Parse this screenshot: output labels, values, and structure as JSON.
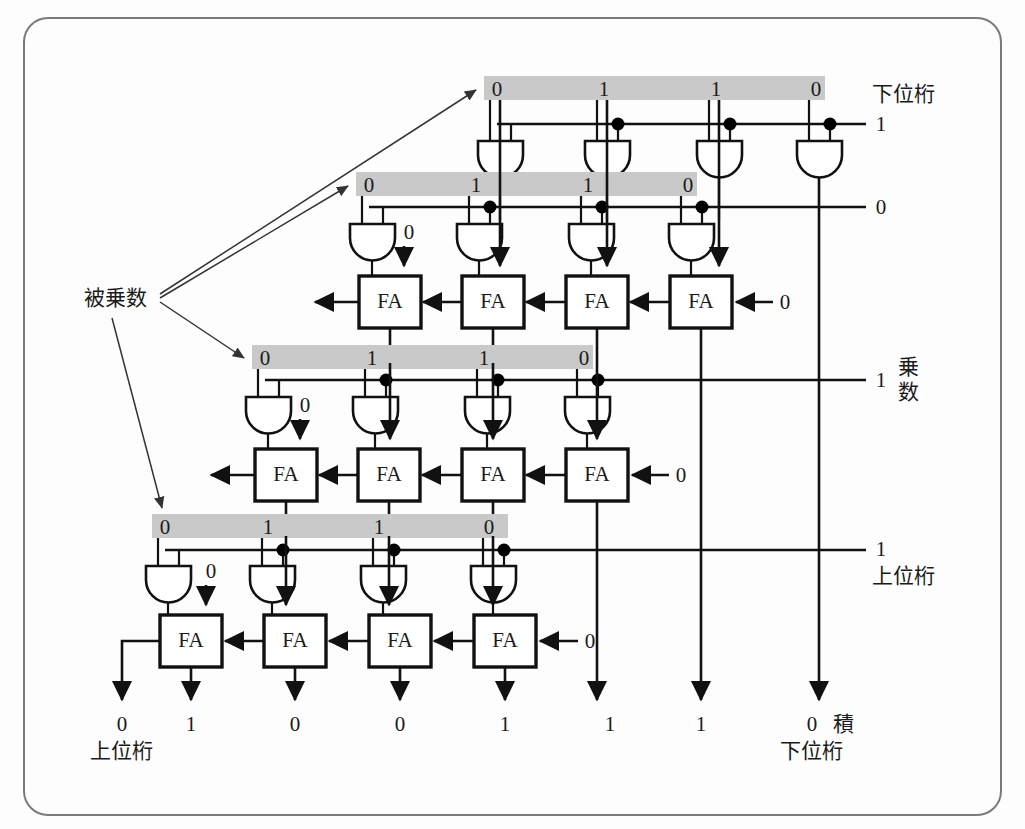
{
  "figure": {
    "frame_color": "#7a7a7a",
    "band_color": "#c9c9c9"
  },
  "labels": {
    "multiplicand": "被乗数",
    "multiplier": "乗数",
    "product": "積",
    "lower_digit": "下位桁",
    "upper_digit": "上位桁",
    "fa": "FA"
  },
  "multiplicand_bits": [
    "0",
    "1",
    "1",
    "0"
  ],
  "multiplier_bits": [
    "1",
    "0",
    "1",
    "1"
  ],
  "rows": [
    {
      "index": 1,
      "band_bits": [
        "0",
        "1",
        "1",
        "0"
      ],
      "multiplier_bit": "1",
      "right_label": "下位桁",
      "has_adders": false,
      "carry_in": null
    },
    {
      "index": 2,
      "band_bits": [
        "0",
        "1",
        "1",
        "0"
      ],
      "multiplier_bit": "0",
      "right_label": "",
      "has_adders": true,
      "carry_in": "0",
      "extra_input": "0"
    },
    {
      "index": 3,
      "band_bits": [
        "0",
        "1",
        "1",
        "0"
      ],
      "multiplier_bit": "1",
      "right_label": "乗数",
      "has_adders": true,
      "carry_in": "0",
      "extra_input": "0"
    },
    {
      "index": 4,
      "band_bits": [
        "0",
        "1",
        "1",
        "0"
      ],
      "multiplier_bit": "1",
      "right_label": "上位桁",
      "has_adders": true,
      "carry_in": "0",
      "extra_input": "0"
    }
  ],
  "product_bits": [
    "0",
    "1",
    "0",
    "0",
    "1",
    "1",
    "1",
    "0"
  ],
  "product_left_label": "上位桁",
  "product_right_label": "下位桁",
  "product_name": "積"
}
